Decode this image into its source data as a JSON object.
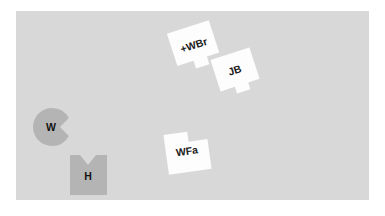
{
  "canvas": {
    "name": "shape-workspace",
    "background_color": "#d8d8d8",
    "page_background_color": "#ffffff",
    "x": 16,
    "y": 11,
    "width": 353,
    "height": 189
  },
  "palette": {
    "canvas_gray": "#d8d8d8",
    "shape_dark_gray": "#b4b4b4",
    "shape_white": "#fdfdfd",
    "label_text": "#1c1c1c",
    "page_white": "#ffffff"
  },
  "shapes": [
    {
      "id": "w-piece",
      "label": "W",
      "kind": "pac-man-circle",
      "fill": "#b4b4b4",
      "label_x": 51,
      "label_y": 128,
      "cx": 52,
      "cy": 127,
      "r": 19,
      "notch_start_deg": -28,
      "notch_end_deg": 28,
      "notch_depth": 9
    },
    {
      "id": "h-piece",
      "label": "H",
      "kind": "notched-square",
      "fill": "#b4b4b4",
      "label_x": 88,
      "label_y": 177,
      "x": 70,
      "y": 155,
      "width": 37,
      "height": 40,
      "notch_width": 16,
      "notch_depth": 10
    },
    {
      "id": "wbr-piece",
      "label": "+WBr",
      "kind": "notched-quad",
      "fill": "#fdfdfd",
      "label_x": 194,
      "label_y": 46,
      "rotation_deg": -18
    },
    {
      "id": "jb-piece",
      "label": "JB",
      "kind": "notched-quad",
      "fill": "#fdfdfd",
      "label_x": 235,
      "label_y": 71,
      "rotation_deg": -18
    },
    {
      "id": "wfa-piece",
      "label": "WFa",
      "kind": "notched-quad",
      "fill": "#fdfdfd",
      "label_x": 187,
      "label_y": 152,
      "rotation_deg": -8
    }
  ]
}
